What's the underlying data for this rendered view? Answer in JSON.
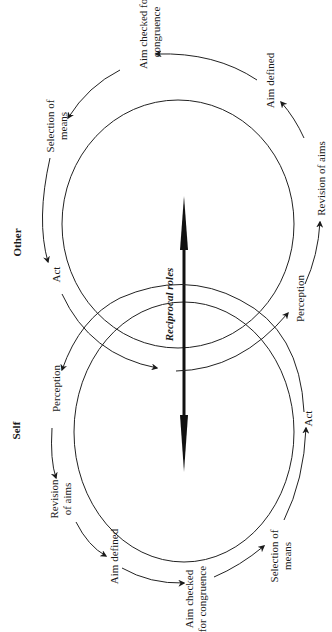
{
  "diagram": {
    "orientation": "rotated -90deg",
    "central_label": "Reciprocal roles",
    "other": {
      "title": "Other",
      "cycle": [
        "Perception",
        "Revision of aims",
        "Aim defined",
        "Aim checked for congruence",
        "Selection of means",
        "Act"
      ]
    },
    "self": {
      "title": "Self",
      "cycle": [
        "Perception",
        "Revision of aims",
        "Aim defined",
        "Aim checked for congruence",
        "Selection of means",
        "Act"
      ]
    }
  },
  "labels": {
    "other_title": "Other",
    "self_title": "Self",
    "reciprocal": "Reciprocal roles",
    "o_aim_checked_1": "Aim checked for",
    "o_aim_checked_2": "congruence",
    "o_aim_defined": "Aim defined",
    "o_selection_1": "Selection of",
    "o_selection_2": "means",
    "o_revision": "Revision of aims",
    "o_act": "Act",
    "o_perception": "Perception",
    "s_perception": "Perception",
    "s_revision_1": "Revision",
    "s_revision_2": "of aims",
    "s_aim_defined": "Aim defined",
    "s_aim_checked_1": "Aim checked",
    "s_aim_checked_2": "for congruence",
    "s_selection_1": "Selection of",
    "s_selection_2": "means",
    "s_act": "Act"
  }
}
